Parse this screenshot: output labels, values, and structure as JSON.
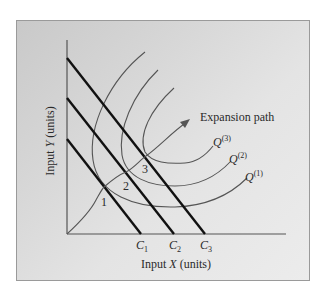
{
  "figure": {
    "x_axis_label": "Input X (units)",
    "y_axis_label": "Input Y (units)",
    "isocost_labels": [
      "C1",
      "C2",
      "C3"
    ],
    "isoquant_labels": [
      "Q(1)",
      "Q(2)",
      "Q(3)"
    ],
    "tangency_point_labels": [
      "1",
      "2",
      "3"
    ],
    "expansion_path_label": "Expansion path"
  },
  "labels": {
    "xaxis_main": "Input ",
    "xaxis_var": "X",
    "xaxis_unit": " (units)",
    "yaxis_main": "Input ",
    "yaxis_var": "Y",
    "yaxis_unit": " (units)",
    "c_letter": "C",
    "c1_sub": "1",
    "c2_sub": "2",
    "c3_sub": "3",
    "q_letter": "Q",
    "q1_sup": "(1)",
    "q2_sup": "(2)",
    "q3_sup": "(3)",
    "pt1": "1",
    "pt2": "2",
    "pt3": "3",
    "expansion": "Expansion path"
  },
  "colors": {
    "background_outer": "#ffffff",
    "panel_left": "#c9c9c9",
    "panel_right": "#ececec",
    "isocost_lines": "#111111",
    "isoquants": "#555555",
    "text": "#2a2a2a"
  }
}
